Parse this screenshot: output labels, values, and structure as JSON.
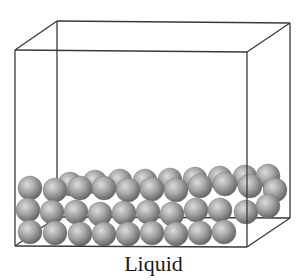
{
  "figure": {
    "caption": "Liquid",
    "colors": {
      "outline": "#3a3a3a",
      "sphere_light": "#d4d4d4",
      "sphere_mid": "#9a9a9a",
      "sphere_dark": "#5e5e5e",
      "background": "#ffffff"
    },
    "box": {
      "front_top_left": [
        15,
        50
      ],
      "front_top_right": [
        247,
        52
      ],
      "front_bottom_left": [
        15,
        246
      ],
      "front_bottom_right": [
        247,
        247
      ],
      "back_top_left": [
        57,
        21
      ],
      "back_top_right": [
        290,
        23
      ],
      "back_bottom_left": [
        57,
        217
      ],
      "back_bottom_right": [
        290,
        218
      ]
    },
    "sphere_radius": 12,
    "spheres": {
      "back_row": [
        [
          70,
          184
        ],
        [
          95,
          182
        ],
        [
          120,
          181
        ],
        [
          145,
          181
        ],
        [
          170,
          180
        ],
        [
          195,
          179
        ],
        [
          220,
          178
        ],
        [
          245,
          177
        ],
        [
          268,
          176
        ]
      ],
      "top_row": [
        [
          30,
          188
        ],
        [
          55,
          190
        ],
        [
          80,
          188
        ],
        [
          104,
          188
        ],
        [
          128,
          190
        ],
        [
          152,
          189
        ],
        [
          176,
          190
        ],
        [
          200,
          186
        ],
        [
          225,
          184
        ],
        [
          250,
          186
        ],
        [
          275,
          190
        ]
      ],
      "middle_row": [
        [
          28,
          210
        ],
        [
          52,
          212
        ],
        [
          76,
          212
        ],
        [
          100,
          214
        ],
        [
          124,
          213
        ],
        [
          148,
          212
        ],
        [
          172,
          214
        ],
        [
          196,
          210
        ],
        [
          220,
          210
        ],
        [
          246,
          212
        ],
        [
          268,
          206
        ]
      ],
      "bottom_row": [
        [
          30,
          232
        ],
        [
          55,
          233
        ],
        [
          80,
          234
        ],
        [
          104,
          234
        ],
        [
          128,
          234
        ],
        [
          152,
          233
        ],
        [
          176,
          234
        ],
        [
          200,
          233
        ],
        [
          224,
          232
        ]
      ]
    }
  }
}
